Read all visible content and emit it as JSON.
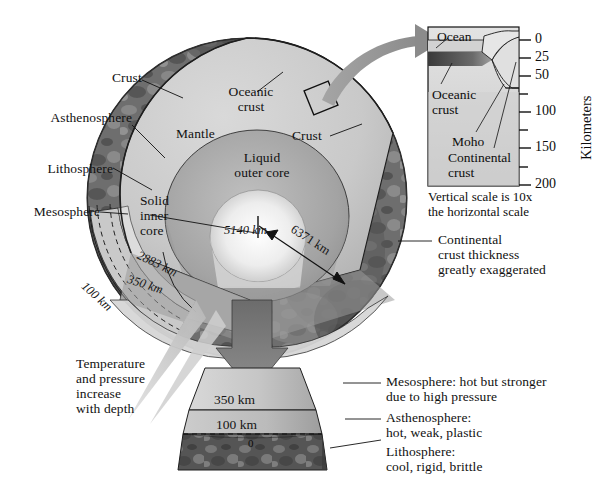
{
  "figure": {
    "background": "#ffffff",
    "width": 604,
    "height": 492
  },
  "colors": {
    "mantle": "#cbcbcb",
    "outer_core": "#a6a6a6",
    "inner_core": "#f2f2f2",
    "mesosphere_face": "#b9b9b9",
    "asthenosphere_face": "#cfcfcf",
    "lithosphere_dark": "#4a4a4a",
    "globe_surface": "#7d7d7d",
    "arrow_gray": "#8e8e8e",
    "stroke": "#1a1a1a",
    "ocean": "#d9d9d9",
    "oceanic_crust": "#5a5a5a",
    "continental_crust": "#d2d2d2",
    "inset_background": "#dadada"
  },
  "globe_labels": {
    "crust_left": "Crust",
    "oceanic_crust": "Oceanic\ncrust",
    "crust_right": "Crust",
    "mantle": "Mantle",
    "liquid_outer_core": "Liquid\nouter core",
    "solid_inner_core": "Solid\ninner\ncore",
    "asthenosphere": "Asthenosphere",
    "lithosphere": "Lithosphere",
    "mesosphere": "Mesosphere"
  },
  "depth_annotations": [
    {
      "name": "inner-core-radius",
      "text": "5140 km"
    },
    {
      "name": "earth-radius",
      "text": "6371 km"
    },
    {
      "name": "core-mantle-boundary",
      "text": "2883 km"
    },
    {
      "name": "mesosphere-boundary-globe",
      "text": "350 km"
    },
    {
      "name": "lithosphere-boundary-globe",
      "text": "100 km"
    }
  ],
  "wedge": {
    "mesosphere_depth": "350 km",
    "asthenosphere_depth": "100 km",
    "surface_depth": "0"
  },
  "callouts": {
    "temperature": "Temperature\nand pressure\nincrease\nwith depth",
    "continental_thickness": "Continental\ncrust thickness\ngreatly exaggerated",
    "mesosphere": "Mesosphere: hot but stronger\ndue to high pressure",
    "asthenosphere": "Asthenosphere:\nhot, weak, plastic",
    "lithosphere": "Lithosphere:\ncool, rigid, brittle"
  },
  "inset": {
    "ocean": "Ocean",
    "oceanic_crust": "Oceanic\ncrust",
    "moho": "Moho",
    "continental_crust": "Continental\ncrust",
    "axis_title": "Kilometers",
    "scale_note": "Vertical scale is 10x\nthe horizontal scale",
    "ticks": [
      {
        "label": "0",
        "value": 0,
        "major": true
      },
      {
        "label": "25",
        "value": 25,
        "major": true
      },
      {
        "label": "50",
        "value": 50,
        "major": true
      },
      {
        "label": "",
        "value": 75,
        "major": false
      },
      {
        "label": "100",
        "value": 100,
        "major": true
      },
      {
        "label": "",
        "value": 125,
        "major": false
      },
      {
        "label": "150",
        "value": 150,
        "major": true
      },
      {
        "label": "",
        "value": 175,
        "major": false
      },
      {
        "label": "200",
        "value": 200,
        "major": true
      }
    ]
  }
}
